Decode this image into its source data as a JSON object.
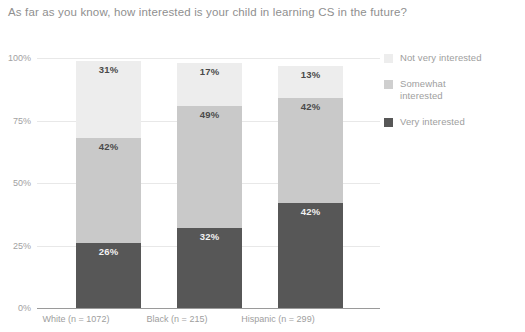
{
  "chart_data": {
    "type": "bar",
    "subtype": "stacked-bar-100",
    "title": "As far as you know, how interested is your child in learning CS in the future?",
    "xlabel": "",
    "ylabel": "",
    "ylim": [
      0,
      100
    ],
    "yticks": [
      "0%",
      "25%",
      "50%",
      "75%",
      "100%"
    ],
    "ytick_values": [
      0,
      25,
      50,
      75,
      100
    ],
    "grid": true,
    "legend_position": "right",
    "categories": [
      "White (n = 1072)",
      "Black (n = 215)",
      "Hispanic (n = 299)"
    ],
    "series": [
      {
        "name": "Very interested",
        "color": "#575757",
        "values": [
          26,
          32,
          42
        ],
        "labels": [
          "26%",
          "32%",
          "42%"
        ]
      },
      {
        "name": "Somewhat interested",
        "color": "#c9c9c9",
        "values": [
          42,
          49,
          42
        ],
        "labels": [
          "42%",
          "49%",
          "42%"
        ]
      },
      {
        "name": "Not very interested",
        "color": "#ededed",
        "values": [
          31,
          17,
          13
        ],
        "labels": [
          "31%",
          "17%",
          "13%"
        ]
      }
    ],
    "legend": [
      {
        "label": "Not very interested",
        "color": "#ededed"
      },
      {
        "label": "Somewhat\ninterested",
        "color": "#cfcfcf"
      },
      {
        "label": "Very interested",
        "color": "#575757"
      }
    ]
  }
}
